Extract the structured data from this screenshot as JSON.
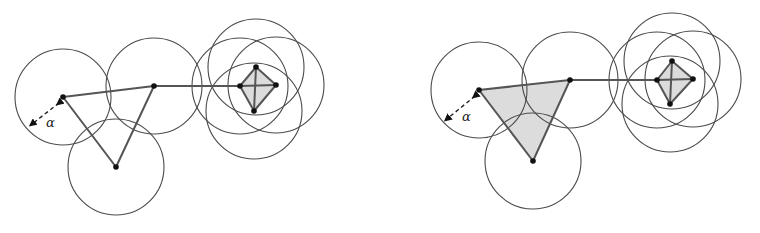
{
  "panels": [
    {
      "id": "left",
      "triangle_filled": false,
      "radius": 48,
      "alpha_label": "α",
      "points": {
        "p1": [
          63,
          97
        ],
        "p2": [
          154,
          86
        ],
        "p3": [
          116,
          167
        ],
        "sq_left": [
          240,
          86
        ],
        "sq_right": [
          276,
          85
        ],
        "sq_top": [
          256,
          67
        ],
        "sq_bottom": [
          254,
          111
        ]
      },
      "alpha_arrow": {
        "from": [
          59,
          103
        ],
        "to": [
          32,
          124
        ],
        "label_pos": [
          46,
          127
        ]
      }
    },
    {
      "id": "right",
      "triangle_filled": true,
      "radius": 48,
      "alpha_label": "α",
      "points": {
        "p1": [
          479,
          90
        ],
        "p2": [
          570,
          80
        ],
        "p3": [
          533,
          161
        ],
        "sq_left": [
          657,
          80
        ],
        "sq_right": [
          693,
          79
        ],
        "sq_top": [
          672,
          61
        ],
        "sq_bottom": [
          670,
          104
        ]
      },
      "alpha_arrow": {
        "from": [
          475,
          96
        ],
        "to": [
          447,
          119
        ],
        "label_pos": [
          462,
          121
        ]
      }
    }
  ],
  "colors": {
    "stroke": "#4a4a4a",
    "edge": "#555555",
    "fill": "#dcdcdc",
    "vertex": "#111111"
  }
}
